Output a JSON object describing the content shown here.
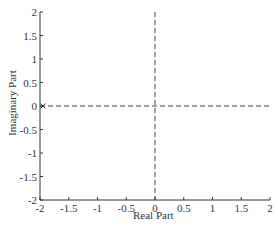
{
  "chart_data": {
    "type": "scatter",
    "title": "",
    "xlabel": "Real Part",
    "ylabel": "Imaginary Part",
    "xlim": [
      -2,
      2
    ],
    "ylim": [
      -2,
      2
    ],
    "xticks": [
      -2,
      -1.5,
      -1,
      -0.5,
      0,
      0.5,
      1,
      1.5,
      2
    ],
    "xtick_labels": [
      "-2",
      "-1.5",
      "-1",
      "-0.5",
      "0",
      "0.5",
      "1",
      "1.5",
      "2"
    ],
    "yticks": [
      -2,
      -1.5,
      -1,
      -0.5,
      0,
      0.5,
      1,
      1.5,
      2
    ],
    "ytick_labels": [
      "-2",
      "-1.5",
      "-1",
      "-0.5",
      "0",
      "0.5",
      "1",
      "1.5",
      "2"
    ],
    "grid": false,
    "reference_lines": [
      {
        "orientation": "horizontal",
        "value": 0,
        "style": "dashed"
      },
      {
        "orientation": "vertical",
        "value": 0,
        "style": "dashed"
      }
    ],
    "series": [
      {
        "name": "poles",
        "marker": "x",
        "points": [
          {
            "x": -2,
            "y": 0
          }
        ]
      }
    ]
  },
  "colors": {
    "axis": "#333333",
    "reference_line": "#444444",
    "marker": "#333333"
  }
}
